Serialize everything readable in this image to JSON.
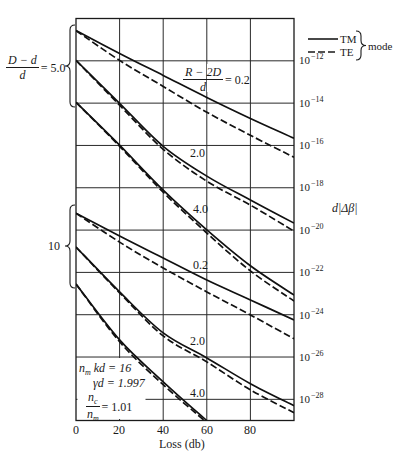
{
  "chart_data": {
    "type": "line",
    "title": "",
    "xlabel": "Loss (db)",
    "ylabel": "d|Δβ|",
    "xscale": "linear",
    "yscale": "log",
    "xlim": [
      0,
      100
    ],
    "ylim": [
      "1e-29",
      "1e-10"
    ],
    "ylim_log10": [
      -29,
      -10
    ],
    "grid": true,
    "x_ticks": [
      0,
      20,
      40,
      60,
      80
    ],
    "x_tick_labels": [
      "0",
      "20",
      "40",
      "60",
      "80"
    ],
    "y_tick_exponents": [
      -12,
      -14,
      -16,
      -18,
      -20,
      -22,
      -24,
      -26,
      -28
    ],
    "y_tick_labels": [
      {
        "base": "10",
        "exp": "−12"
      },
      {
        "base": "10",
        "exp": "−14"
      },
      {
        "base": "10",
        "exp": "−16"
      },
      {
        "base": "10",
        "exp": "−18"
      },
      {
        "base": "10",
        "exp": "−20"
      },
      {
        "base": "10",
        "exp": "−22"
      },
      {
        "base": "10",
        "exp": "−24"
      },
      {
        "base": "10",
        "exp": "−26"
      },
      {
        "base": "10",
        "exp": "−28"
      }
    ],
    "legend": {
      "position": "upper right, outside plot",
      "entries": [
        {
          "label": "TM",
          "style": "solid"
        },
        {
          "label": "TE",
          "style": "dashed"
        }
      ],
      "group_label": "mode"
    },
    "groups": [
      {
        "label": {
          "num": "D − d",
          "den": "d",
          "value": "= 5.0"
        },
        "value": 5.0
      },
      {
        "label": {
          "value": "10"
        },
        "value": 10
      }
    ],
    "curve_labels": {
      "main": {
        "num": "R − 2D",
        "den": "d",
        "value": "= 0.2"
      },
      "g1_2": "2.0",
      "g1_3": "4.0",
      "g2_1": "0.2",
      "g2_2": "2.0",
      "g2_3": "4.0"
    },
    "annotations": {
      "nmkd": {
        "var": "n",
        "sub": "m",
        "rest": " kd = 16"
      },
      "gammad": {
        "text": "γd = 1.997"
      },
      "ratio": {
        "num_var": "n",
        "num_sub": "c",
        "den_var": "n",
        "den_sub": "m",
        "value": "= 1.01"
      }
    },
    "series": [
      {
        "name": "(D−d)/d=5.0, (R−2D)/d=0.2, TM",
        "group": 0,
        "param": 0.2,
        "mode": "TM",
        "x": [
          0,
          20,
          40,
          60,
          80,
          100
        ],
        "log10_y": [
          -10.57,
          -11.65,
          -12.69,
          -13.73,
          -14.72,
          -15.66
        ]
      },
      {
        "name": "(D−d)/d=5.0, (R−2D)/d=0.2, TE",
        "group": 0,
        "param": 0.2,
        "mode": "TE",
        "x": [
          0,
          20,
          40,
          60,
          80,
          100
        ],
        "log10_y": [
          -10.57,
          -11.98,
          -13.21,
          -14.43,
          -15.52,
          -16.56
        ]
      },
      {
        "name": "(D−d)/d=5.0, (R−2D)/d=2.0, TM",
        "group": 0,
        "param": 2.0,
        "mode": "TM",
        "x": [
          0,
          20,
          40,
          60,
          80,
          100
        ],
        "log10_y": [
          -11.98,
          -14.01,
          -16.04,
          -17.45,
          -18.58,
          -19.67
        ]
      },
      {
        "name": "(D−d)/d=5.0, (R−2D)/d=2.0, TE",
        "group": 0,
        "param": 2.0,
        "mode": "TE",
        "x": [
          0,
          20,
          40,
          60,
          80,
          100
        ],
        "log10_y": [
          -11.98,
          -14.1,
          -16.18,
          -17.69,
          -18.82,
          -20.05
        ]
      },
      {
        "name": "(D−d)/d=5.0, (R−2D)/d=4.0, TM",
        "group": 0,
        "param": 4.0,
        "mode": "TM",
        "x": [
          0,
          20,
          40,
          60,
          80,
          100
        ],
        "log10_y": [
          -13.96,
          -15.99,
          -18.11,
          -19.99,
          -21.69,
          -23.07
        ]
      },
      {
        "name": "(D−d)/d=5.0, (R−2D)/d=4.0, TE",
        "group": 0,
        "param": 4.0,
        "mode": "TE",
        "x": [
          0,
          20,
          40,
          60,
          80,
          100
        ],
        "log10_y": [
          -13.96,
          -16.04,
          -18.21,
          -20.14,
          -21.93,
          -23.35
        ]
      },
      {
        "name": "(D−d)/d=10, (R−2D)/d=0.2, TM",
        "group": 1,
        "param": 0.2,
        "mode": "TM",
        "x": [
          0,
          20,
          40,
          60,
          80,
          100
        ],
        "log10_y": [
          -19.2,
          -20.28,
          -21.32,
          -22.36,
          -23.3,
          -24.25
        ]
      },
      {
        "name": "(D−d)/d=10, (R−2D)/d=0.2, TE",
        "group": 1,
        "param": 0.2,
        "mode": "TE",
        "x": [
          0,
          20,
          40,
          60,
          80,
          100
        ],
        "log10_y": [
          -19.2,
          -20.57,
          -21.79,
          -22.92,
          -24.01,
          -25.14
        ]
      },
      {
        "name": "(D−d)/d=10, (R−2D)/d=2.0, TM",
        "group": 1,
        "param": 2.0,
        "mode": "TM",
        "x": [
          0,
          20,
          40,
          60,
          80,
          100
        ],
        "log10_y": [
          -20.8,
          -22.92,
          -24.86,
          -26.04,
          -27.26,
          -28.3
        ]
      },
      {
        "name": "(D−d)/d=10, (R−2D)/d=2.0, TE",
        "group": 1,
        "param": 2.0,
        "mode": "TE",
        "x": [
          0,
          20,
          40,
          60,
          80,
          100
        ],
        "log10_y": [
          -20.8,
          -22.97,
          -25.0,
          -26.23,
          -27.55,
          -28.63
        ]
      },
      {
        "name": "(D−d)/d=10, (R−2D)/d=4.0, TM",
        "group": 1,
        "param": 4.0,
        "mode": "TM",
        "x": [
          0,
          20,
          40,
          60
        ],
        "log10_y": [
          -22.55,
          -25.19,
          -27.17,
          -29.01
        ]
      },
      {
        "name": "(D−d)/d=10, (R−2D)/d=4.0, TE",
        "group": 1,
        "param": 4.0,
        "mode": "TE",
        "x": [
          0,
          20,
          40,
          59
        ],
        "log10_y": [
          -22.55,
          -25.28,
          -27.31,
          -29.01
        ]
      }
    ]
  }
}
